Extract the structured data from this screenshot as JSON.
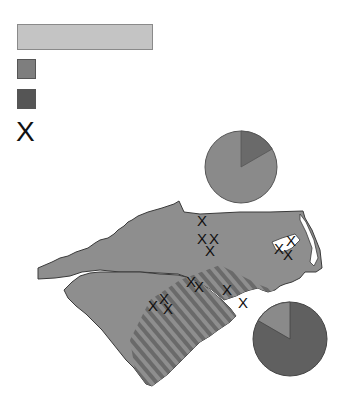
{
  "legend": {
    "title": "",
    "items": [
      {
        "symbol": "swatch",
        "color": "#7e7e7e",
        "label": ""
      },
      {
        "symbol": "swatch",
        "color": "#555555",
        "label": ""
      },
      {
        "symbol": "x-marker",
        "glyph": "X",
        "label": ""
      }
    ]
  },
  "map": {
    "regions": [
      {
        "name": "North Carolina",
        "fill": "#8e8e8e",
        "pattern": "partial-diagonal-stripes"
      },
      {
        "name": "South Carolina",
        "fill": "#8e8e8e",
        "pattern": "partial-diagonal-stripes"
      }
    ],
    "stripe_color": "#6a6a6a",
    "marker_glyph": "X",
    "marker_count": 16
  },
  "pies": [
    {
      "name": "upper-pie",
      "slices": [
        {
          "share": 17,
          "color": "#6a6a6a"
        },
        {
          "share": 83,
          "color": "#8a8a8a"
        }
      ]
    },
    {
      "name": "lower-pie",
      "slices": [
        {
          "share": 17,
          "color": "#8a8a8a"
        },
        {
          "share": 83,
          "color": "#606060"
        }
      ]
    }
  ]
}
